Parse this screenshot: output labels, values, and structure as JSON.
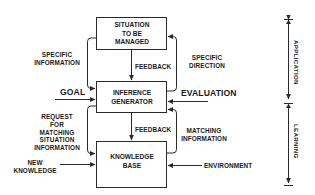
{
  "diagram": {
    "type": "flow-block-diagram",
    "boxes": [
      {
        "id": "situation",
        "lines": [
          "SITUATION",
          "TO BE",
          "MANAGED"
        ]
      },
      {
        "id": "inference",
        "lines": [
          "INFERENCE",
          "GENERATOR"
        ]
      },
      {
        "id": "knowledge",
        "lines": [
          "KNOWLEDGE",
          "BASE"
        ]
      }
    ],
    "edges": {
      "feedback_top": "FEEDBACK",
      "feedback_bottom": "FEEDBACK",
      "specific_information": [
        "SPECIFIC",
        "INFORMATION"
      ],
      "specific_direction": [
        "SPECIFIC",
        "DIRECTION"
      ],
      "request": [
        "REQUEST",
        "FOR",
        "MATCHING",
        "SITUATION",
        "INFORMATION"
      ],
      "matching_information": [
        "MATCHING",
        "INFORMATION"
      ]
    },
    "inputs": {
      "goal": "GOAL",
      "evaluation": "EVALUATION",
      "new_knowledge": [
        "NEW",
        "KNOWLEDGE"
      ],
      "environment": "ENVIRONMENT"
    },
    "phases": {
      "application": "APPLICATION",
      "learning": "LEARNING"
    },
    "colors": {
      "line": "#2a2a2a",
      "text": "#1a1a1a",
      "background": "#ffffff"
    }
  }
}
